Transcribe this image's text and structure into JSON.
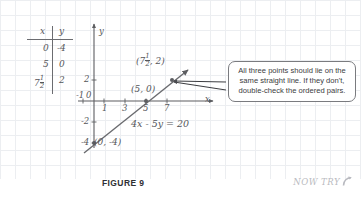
{
  "figure": {
    "caption": "FIGURE 9",
    "now_try_label": "NOW TRY",
    "now_try_icon": "curved-arrow-icon",
    "background": "#ffffff",
    "grid_color": "#e9ecef",
    "ink_color": "#55565a"
  },
  "value_table": {
    "headers": [
      "x",
      "y"
    ],
    "rows": [
      {
        "x": "0",
        "y": "-4"
      },
      {
        "x": "5",
        "y": "0"
      },
      {
        "x_whole": "7",
        "x_frac_num": "1",
        "x_frac_den": "2",
        "y": "2"
      }
    ]
  },
  "graph": {
    "x_axis_label": "x",
    "y_axis_label": "y",
    "x_ticks": [
      "-1",
      "0",
      "1",
      "3",
      "5",
      "7"
    ],
    "y_ticks": [
      "2",
      "-2",
      "-4"
    ],
    "equation_label": "4x - 5y = 20",
    "points": [
      {
        "label": "(5, 0)",
        "x": 5,
        "y": 0
      },
      {
        "label_whole": "(7",
        "label_frac_num": "1",
        "label_frac_den": "2",
        "label_tail": ", 2)",
        "x": 7.5,
        "y": 2
      },
      {
        "label": "(0, -4)",
        "x": 0,
        "y": -4
      }
    ],
    "line": {
      "slope": 0.8,
      "intercept": -4,
      "style": "solid-with-arrowheads"
    }
  },
  "callout": {
    "text": "All three points should lie on the same straight line. If they don't, double-check the ordered pairs.",
    "border_color": "#7a7b7f",
    "pointer_targets": 2
  }
}
